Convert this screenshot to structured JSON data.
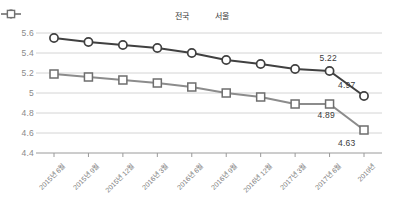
{
  "legend": {
    "position": "top-center",
    "items": [
      {
        "label": "전국",
        "marker": "circle-marker-icon",
        "color": "#404040"
      },
      {
        "label": "서울",
        "marker": "square-marker-icon",
        "color": "#8c8c8c"
      }
    ]
  },
  "axes": {
    "y_ticks": [
      "5.6",
      "5.4",
      "5.2",
      "5",
      "4.8",
      "4.6",
      "4.4"
    ],
    "x_ticks": [
      "2015년 6월",
      "2015년 9월",
      "2015년 12월",
      "2016년 3월",
      "2016년 6월",
      "2016년 9월",
      "2016년 12월",
      "2017년 3월",
      "2017년 6월",
      "2019년"
    ]
  },
  "annotations": [
    {
      "text": "5.22",
      "series": "전국",
      "index": 8
    },
    {
      "text": "4.97",
      "series": "전국",
      "index": 9
    },
    {
      "text": "4.89",
      "series": "서울",
      "index": 8
    },
    {
      "text": "4.63",
      "series": "서울",
      "index": 9
    }
  ],
  "chart_data": {
    "type": "line",
    "title": "",
    "subtitle": "",
    "xlabel": "",
    "ylabel": "",
    "ylim": [
      4.4,
      5.6
    ],
    "ytick_step": 0.2,
    "grid": true,
    "legend_position": "top-center",
    "categories": [
      "2015년 6월",
      "2015년 9월",
      "2015년 12월",
      "2016년 3월",
      "2016년 6월",
      "2016년 9월",
      "2016년 12월",
      "2017년 3월",
      "2017년 6월",
      "2019년"
    ],
    "series": [
      {
        "name": "전국",
        "marker": "circle",
        "color": "#404040",
        "values": [
          5.55,
          5.51,
          5.48,
          5.45,
          5.4,
          5.33,
          5.29,
          5.24,
          5.22,
          4.97
        ],
        "labeled_points": {
          "8": "5.22",
          "9": "4.97"
        }
      },
      {
        "name": "서울",
        "marker": "square",
        "color": "#8c8c8c",
        "values": [
          5.19,
          5.16,
          5.13,
          5.1,
          5.06,
          5.0,
          4.96,
          4.89,
          4.89,
          4.63
        ],
        "labeled_points": {
          "8": "4.89",
          "9": "4.63"
        }
      }
    ]
  }
}
